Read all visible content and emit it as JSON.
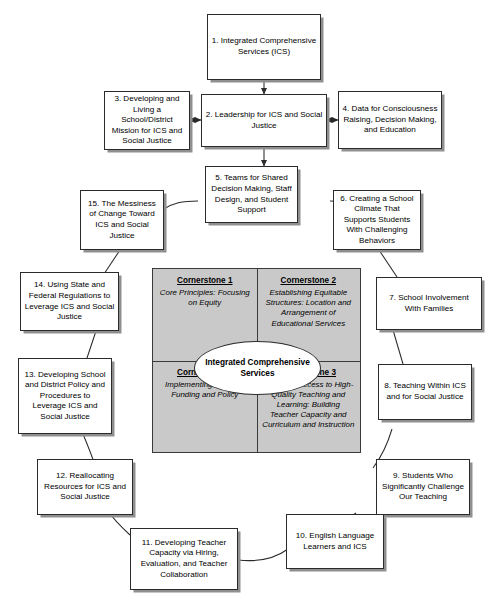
{
  "diagram": {
    "nodes": [
      {
        "id": 1,
        "label": "1. Integrated Comprehensive Services (ICS)"
      },
      {
        "id": 2,
        "label": "2. Leadership for ICS and Social Justice"
      },
      {
        "id": 3,
        "label": "3. Developing and Living a School/District Mission for ICS and Social Justice"
      },
      {
        "id": 4,
        "label": "4. Data for Consciousness Raising, Decision Making, and Education"
      },
      {
        "id": 5,
        "label": "5. Teams for Shared Decision Making, Staff Design, and Student Support"
      },
      {
        "id": 6,
        "label": "6. Creating a School Climate That Supports Students With Challenging Behaviors"
      },
      {
        "id": 7,
        "label": "7. School Involvement With Families"
      },
      {
        "id": 8,
        "label": "8. Teaching Within ICS and for Social Justice"
      },
      {
        "id": 9,
        "label": "9. Students Who Significantly Challenge Our Teaching"
      },
      {
        "id": 10,
        "label": "10. English Language Learners and ICS"
      },
      {
        "id": 11,
        "label": "11. Developing Teacher Capacity via Hiring, Evaluation, and Teacher Collaboration"
      },
      {
        "id": 12,
        "label": "12. Reallocating Resources for ICS and Social Justice"
      },
      {
        "id": 13,
        "label": "13. Developing School and District Policy and Procedures to Leverage ICS and Social Justice"
      },
      {
        "id": 14,
        "label": "14. Using State and Federal Regulations to Leverage ICS and Social Justice"
      },
      {
        "id": 15,
        "label": "15. The Messiness of Change Toward ICS and Social Justice"
      }
    ],
    "center": {
      "oval_label": "Integrated Comprehensive Services",
      "quadrants": [
        {
          "heading": "Cornerstone 1",
          "body": "Core Principles: Focusing on Equity"
        },
        {
          "heading": "Cornerstone 2",
          "body": "Establishing Equitable Structures: Location and Arrangement of Educational Services"
        },
        {
          "heading": "Cornerstone 3",
          "body": "Providing Access to High-Quality Teaching and Learning: Building Teacher Capacity and Curriculum and Instruction"
        },
        {
          "heading": "Cornerstone 4",
          "body": "Implementing Change: Funding and Policy"
        }
      ]
    },
    "colors": {
      "panel_fill": "#c9c9c9",
      "box_fill": "#ffffff",
      "stroke": "#2b2b2b",
      "shadow": "#8f8f8f"
    }
  }
}
